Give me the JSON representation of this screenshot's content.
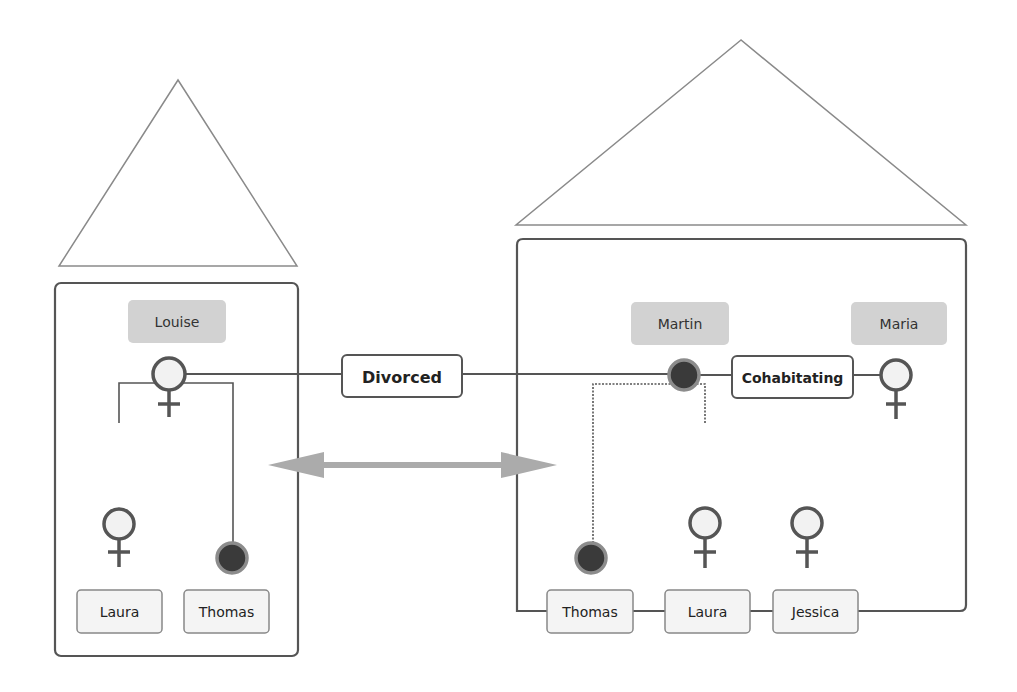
{
  "colors": {
    "line": "#555555",
    "roof": "#8a8a8a",
    "parent_box_fill": "#d2d2d2",
    "child_box_fill": "#f4f4f4",
    "male_fill": "#3a3a3a",
    "male_ring": "#8c8c8c",
    "female_fill": "#f2f2f2",
    "arrow": "#ababab",
    "text": "#222222"
  },
  "households": {
    "left": {
      "parent": {
        "name": "Louise",
        "gender": "female"
      },
      "children": [
        {
          "name": "Laura",
          "gender": "female"
        },
        {
          "name": "Thomas",
          "gender": "male"
        }
      ]
    },
    "right": {
      "parents": [
        {
          "name": "Martin",
          "gender": "male"
        },
        {
          "name": "Maria",
          "gender": "female"
        }
      ],
      "children": [
        {
          "name": "Thomas",
          "gender": "male"
        },
        {
          "name": "Laura",
          "gender": "female"
        },
        {
          "name": "Jessica",
          "gender": "female"
        }
      ]
    }
  },
  "relations": {
    "divorced": "Divorced",
    "cohabitating": "Cohabitating"
  },
  "icons": {
    "female": "female-symbol-icon",
    "male": "male-filled-circle-icon",
    "transfer": "double-headed-arrow-icon",
    "roof": "house-roof-triangle"
  }
}
